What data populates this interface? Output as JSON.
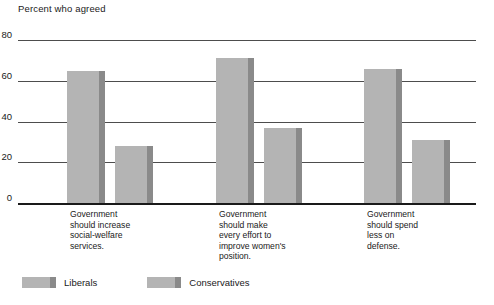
{
  "chart_data": {
    "type": "bar",
    "title": "Percent who agreed",
    "xlabel": "",
    "ylabel": "",
    "ylim": [
      0,
      80
    ],
    "yticks": [
      0,
      20,
      40,
      60,
      80
    ],
    "grid": true,
    "legend_position": "bottom-left",
    "categories": [
      "Government\nshould increase\nsocial-welfare\nservices.",
      "Government\nshould make\nevery effort to\nimprove women's\nposition.",
      "Government\nshould spend\nless on\ndefense."
    ],
    "series": [
      {
        "name": "Liberals",
        "values": [
          65,
          71,
          66
        ],
        "color": "#b4b4b4",
        "edge_color": "#8a8a8a"
      },
      {
        "name": "Conservatives",
        "values": [
          28,
          37,
          31
        ],
        "color": "#b4b4b4",
        "edge_color": "#8a8a8a"
      }
    ]
  },
  "legend": {
    "items": [
      {
        "label": "Liberals"
      },
      {
        "label": "Conservatives"
      }
    ]
  },
  "axis": {
    "tick_0": "0",
    "tick_20": "20",
    "tick_40": "40",
    "tick_60": "60",
    "tick_80": "80"
  }
}
